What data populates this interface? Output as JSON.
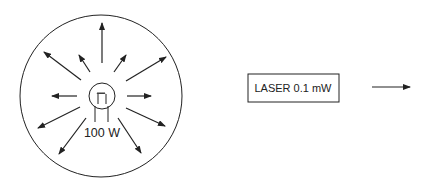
{
  "bulb": {
    "label": "100 W"
  },
  "laser": {
    "label": "LASER 0.1 mW"
  },
  "colors": {
    "stroke": "#222222",
    "background": "#ffffff"
  }
}
